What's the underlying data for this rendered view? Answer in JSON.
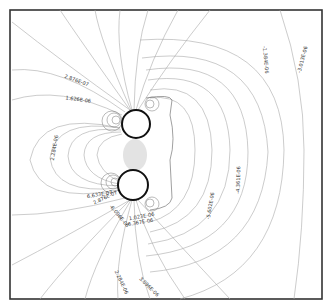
{
  "figure": {
    "type": "contour-plot",
    "colors": {
      "background": "#ffffff",
      "frame": "#333333",
      "contour": "#aaaaaa",
      "contour_dense": "#666666",
      "circle": "#111111",
      "label": "#333333"
    },
    "frame": {
      "x": 10,
      "y": 10,
      "width": 312,
      "height": 289
    },
    "circles": [
      {
        "name": "upper-conductor",
        "cx": 136,
        "cy": 124,
        "r": 14
      },
      {
        "name": "lower-conductor",
        "cx": 133,
        "cy": 185,
        "r": 15
      }
    ],
    "labels": [
      {
        "text": "2.876E-07",
        "x": 76,
        "y": 82,
        "angle": 20
      },
      {
        "text": "1.626E-06",
        "x": 78,
        "y": 101,
        "angle": 8
      },
      {
        "text": "2.284E-06",
        "x": 56,
        "y": 148,
        "angle": -80
      },
      {
        "text": "-1.384E-06",
        "x": 264,
        "y": 60,
        "angle": 85
      },
      {
        "text": "-3.013E-06",
        "x": 304,
        "y": 60,
        "angle": -75
      },
      {
        "text": "-4.361E-06",
        "x": 240,
        "y": 180,
        "angle": -88
      },
      {
        "text": "-5.602E-06",
        "x": 212,
        "y": 206,
        "angle": -80
      },
      {
        "text": "6.633E-07",
        "x": 100,
        "y": 196,
        "angle": -10
      },
      {
        "text": "2.876E-07",
        "x": 106,
        "y": 199,
        "angle": -25
      },
      {
        "text": "-6.096E-06",
        "x": 118,
        "y": 217,
        "angle": 50
      },
      {
        "text": "1.023E-06",
        "x": 142,
        "y": 218,
        "angle": -10
      },
      {
        "text": "-6.367E-06",
        "x": 140,
        "y": 224,
        "angle": -10
      },
      {
        "text": "2.284E-06",
        "x": 120,
        "y": 283,
        "angle": 65
      },
      {
        "text": "3.096E-06",
        "x": 148,
        "y": 288,
        "angle": 45
      }
    ]
  }
}
